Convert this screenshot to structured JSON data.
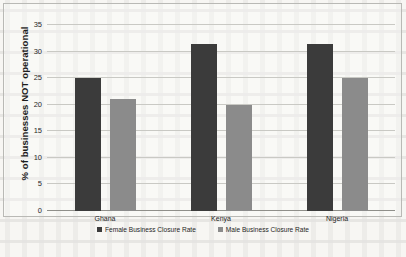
{
  "chart_data": {
    "type": "bar",
    "title": "",
    "xlabel": "",
    "ylabel": "% of businesses NOT operational",
    "categories": [
      "Ghana",
      "Kenya",
      "Nigeria"
    ],
    "series": [
      {
        "name": "Female Business Closure Rate",
        "color": "#3b3b3b",
        "values": [
          25,
          31.5,
          31.5
        ]
      },
      {
        "name": "Male Business Closure Rate",
        "color": "#8b8b8b",
        "values": [
          21,
          20,
          25
        ]
      }
    ],
    "ylim": [
      0,
      35
    ],
    "yticks": [
      0,
      5,
      10,
      15,
      20,
      25,
      30,
      35
    ],
    "ytick_labels": [
      "0",
      "5",
      "10",
      "15",
      "20",
      "25",
      "30",
      "35"
    ],
    "grid": true,
    "legend_position": "bottom"
  },
  "colors": {
    "female": "#3b3b3b",
    "male": "#8b8b8b",
    "gridline": "#c9c9c4",
    "background": "#f7f6f3"
  }
}
